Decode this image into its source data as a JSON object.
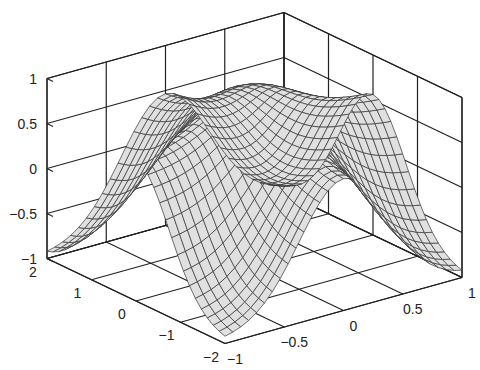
{
  "chart_data": {
    "type": "surface",
    "title": "",
    "xlabel": "",
    "ylabel": "",
    "zlabel": "",
    "x_range": [
      -1,
      1
    ],
    "y_range": [
      -2,
      2
    ],
    "z_range": [
      -1,
      1
    ],
    "x_ticks": [
      "−1",
      "−0.5",
      "0",
      "0.5",
      "1"
    ],
    "x_tick_values": [
      -1,
      -0.5,
      0,
      0.5,
      1
    ],
    "y_ticks": [
      "−2",
      "−1",
      "0",
      "1",
      "2"
    ],
    "y_tick_values": [
      -2,
      -1,
      0,
      1,
      2
    ],
    "z_ticks": [
      "−1",
      "−0.5",
      "0",
      "0.5",
      "1"
    ],
    "z_tick_values": [
      -1,
      -0.5,
      0,
      0.5,
      1
    ],
    "grid_resolution": [
      30,
      30
    ],
    "surface_color": "#e0e0e0",
    "mesh_color": "#333333",
    "box": true,
    "grid": false
  }
}
